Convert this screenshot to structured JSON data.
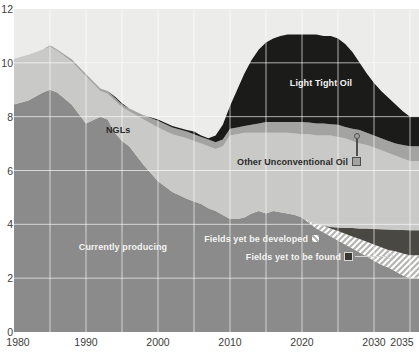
{
  "chart_data": {
    "type": "area",
    "stacked": true,
    "title": "",
    "xlabel": "",
    "ylabel": "",
    "ylim": [
      0,
      12
    ],
    "y_ticks": [
      0,
      2,
      4,
      6,
      8,
      10,
      12
    ],
    "x_ticks": [
      1980,
      1990,
      2000,
      2010,
      2020,
      2030,
      2035
    ],
    "xlim": [
      1980,
      2036.3
    ],
    "grid": "on",
    "gridline_color": "#ffffff",
    "plot_background": "#ecedeb",
    "legend_position": "in-chart labels with callouts",
    "x": [
      1980,
      1982,
      1984,
      1985,
      1986,
      1988,
      1990,
      1992,
      1993,
      1994,
      1995,
      1996,
      1998,
      2000,
      2002,
      2004,
      2005,
      2006,
      2007,
      2008,
      2009,
      2010,
      2011,
      2012,
      2013,
      2014,
      2015,
      2016,
      2017,
      2018,
      2019,
      2020,
      2021,
      2022,
      2023,
      2024,
      2025,
      2026,
      2027,
      2028,
      2029,
      2030,
      2031,
      2032,
      2033,
      2034,
      2035
    ],
    "series": [
      {
        "name": "Currently producing",
        "color": "#8b8b8b",
        "values": [
          8.45,
          8.6,
          8.9,
          9.0,
          8.9,
          8.45,
          7.75,
          8.0,
          7.9,
          7.4,
          7.1,
          6.9,
          6.2,
          5.6,
          5.2,
          4.95,
          4.85,
          4.75,
          4.6,
          4.5,
          4.35,
          4.2,
          4.2,
          4.25,
          4.4,
          4.5,
          4.4,
          4.5,
          4.45,
          4.4,
          4.35,
          4.25,
          4.05,
          3.85,
          3.7,
          3.55,
          3.4,
          3.25,
          3.1,
          2.95,
          2.8,
          2.65,
          2.5,
          2.4,
          2.25,
          2.1,
          2.0
        ]
      },
      {
        "name": "Fields yet be developed",
        "color": "hatch",
        "values": [
          0,
          0,
          0,
          0,
          0,
          0,
          0,
          0,
          0,
          0,
          0,
          0,
          0,
          0,
          0,
          0,
          0,
          0,
          0,
          0,
          0,
          0,
          0,
          0,
          0,
          0,
          0,
          0,
          0,
          0,
          0,
          0,
          0.05,
          0.15,
          0.25,
          0.3,
          0.35,
          0.4,
          0.45,
          0.5,
          0.55,
          0.6,
          0.65,
          0.65,
          0.75,
          0.82,
          0.85
        ]
      },
      {
        "name": "Fields yet to be found",
        "color": "#4a4843",
        "values": [
          0,
          0,
          0,
          0,
          0,
          0,
          0,
          0,
          0,
          0,
          0,
          0,
          0,
          0,
          0,
          0,
          0,
          0,
          0,
          0,
          0,
          0,
          0,
          0,
          0,
          0,
          0,
          0,
          0,
          0,
          0,
          0,
          0,
          0,
          0,
          0.05,
          0.13,
          0.22,
          0.31,
          0.4,
          0.49,
          0.58,
          0.67,
          0.76,
          0.8,
          0.87,
          0.93
        ]
      },
      {
        "name": "NGLs",
        "color": "#c9c9c7",
        "values": [
          1.7,
          1.7,
          1.6,
          1.6,
          1.55,
          1.6,
          1.75,
          0.95,
          0.95,
          1.2,
          1.25,
          1.3,
          1.7,
          2.0,
          2.15,
          2.25,
          2.25,
          2.25,
          2.3,
          2.3,
          2.55,
          3.1,
          3.15,
          3.15,
          3.0,
          2.9,
          3.0,
          2.9,
          2.95,
          3.0,
          3.03,
          3.1,
          3.25,
          3.3,
          3.35,
          3.4,
          3.37,
          3.33,
          3.24,
          3.15,
          3.11,
          3.02,
          2.93,
          2.84,
          2.75,
          2.66,
          2.57
        ]
      },
      {
        "name": "Other Unconventional Oil",
        "color": "#a3a3a1",
        "values": [
          0,
          0,
          0,
          0.05,
          0.05,
          0.08,
          0.08,
          0.1,
          0.1,
          0.1,
          0.1,
          0.1,
          0.15,
          0.25,
          0.25,
          0.25,
          0.25,
          0.25,
          0.25,
          0.25,
          0.25,
          0.25,
          0.25,
          0.25,
          0.3,
          0.35,
          0.4,
          0.4,
          0.4,
          0.4,
          0.42,
          0.45,
          0.43,
          0.45,
          0.45,
          0.42,
          0.45,
          0.42,
          0.45,
          0.5,
          0.45,
          0.45,
          0.45,
          0.45,
          0.45,
          0.5,
          0.55
        ]
      },
      {
        "name": "Light Tight Oil",
        "color": "#1b1b1a",
        "values": [
          0,
          0,
          0,
          0,
          0,
          0,
          0,
          0,
          0,
          0.05,
          0.05,
          0,
          0,
          0.05,
          0.05,
          0.05,
          0.1,
          0.05,
          0.05,
          0.25,
          0.55,
          0.85,
          1.4,
          1.95,
          2.4,
          2.75,
          2.95,
          3.1,
          3.2,
          3.25,
          3.25,
          3.25,
          3.27,
          3.3,
          3.25,
          3.28,
          3.2,
          3.08,
          2.85,
          2.5,
          2.2,
          1.95,
          1.75,
          1.6,
          1.45,
          1.25,
          1.1
        ]
      }
    ]
  }
}
